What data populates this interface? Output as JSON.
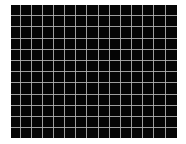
{
  "image": {
    "background_color": "#ffffff",
    "panel": {
      "background_color": "#050505",
      "line_color": "#b8b8b8",
      "x": 11,
      "y": 5,
      "width": 166,
      "height": 133
    },
    "grid": {
      "vertical_lines_x": [
        9,
        20,
        31,
        42,
        53,
        64,
        75,
        87,
        98,
        109,
        120,
        131,
        142,
        154
      ],
      "horizontal_lines_y": [
        10,
        21,
        33,
        44,
        55,
        66,
        77,
        89,
        100,
        111,
        122
      ]
    }
  }
}
